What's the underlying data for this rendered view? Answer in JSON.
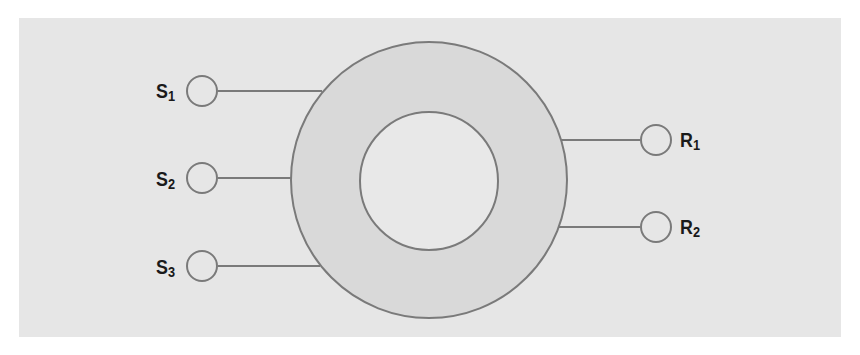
{
  "diagram": {
    "type": "ring-with-terminals",
    "colors": {
      "background": "#ffffff",
      "panel": "#e6e6e6",
      "ring_fill": "#d9d9d9",
      "inner_fill": "#e8e8e8",
      "stroke": "#7a7a7a",
      "label": "#1a1a1a"
    },
    "outer_circle": {
      "cx": 429,
      "cy": 180,
      "r": 138
    },
    "inner_circle": {
      "cx": 429,
      "cy": 181,
      "r": 69
    },
    "left_terminals": [
      {
        "label": "S",
        "sub": "1",
        "cx": 202,
        "cy": 91,
        "line_end_x": 322
      },
      {
        "label": "S",
        "sub": "2",
        "cx": 202,
        "cy": 178,
        "line_end_x": 292
      },
      {
        "label": "S",
        "sub": "3",
        "cx": 202,
        "cy": 266,
        "line_end_x": 320
      }
    ],
    "right_terminals": [
      {
        "label": "R",
        "sub": "1",
        "cx": 656,
        "cy": 140,
        "line_start_x": 560
      },
      {
        "label": "R",
        "sub": "2",
        "cx": 656,
        "cy": 227,
        "line_start_x": 558
      }
    ]
  }
}
